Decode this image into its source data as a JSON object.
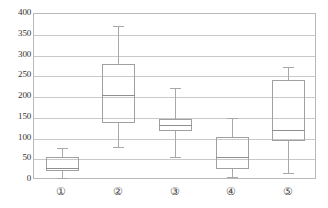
{
  "chart_data": {
    "type": "box",
    "title": "",
    "xlabel": "",
    "ylabel": "",
    "ylim": [
      0,
      400
    ],
    "yticks": [
      0,
      50,
      100,
      150,
      200,
      250,
      300,
      350,
      400
    ],
    "ytick_labels": [
      "0",
      "50",
      "100",
      "150",
      "200",
      "250",
      "300",
      "350",
      "400"
    ],
    "grid": true,
    "legend": "none",
    "categories": [
      "①",
      "②",
      "③",
      "④",
      "⑤"
    ],
    "category_labels": [
      "1",
      "2",
      "3",
      "4",
      "5"
    ],
    "boxes": [
      {
        "category": "①",
        "whisker_low": 5,
        "q1": 21,
        "median": 28,
        "q3": 55,
        "whisker_high": 78
      },
      {
        "category": "②",
        "whisker_low": 80,
        "q1": 137,
        "median": 205,
        "q3": 280,
        "whisker_high": 371
      },
      {
        "category": "③",
        "whisker_low": 55,
        "q1": 117,
        "median": 133,
        "q3": 148,
        "whisker_high": 222
      },
      {
        "category": "④",
        "whisker_low": 8,
        "q1": 27,
        "median": 55,
        "q3": 103,
        "whisker_high": 150
      },
      {
        "category": "⑤",
        "whisker_low": 16,
        "q1": 94,
        "median": 120,
        "q3": 241,
        "whisker_high": 272
      }
    ]
  },
  "style": {
    "axis_color": "#b9b9b9",
    "grid_color": "#c9c9c9",
    "box_color": "#a0a0a0",
    "whisker_color": "#a8a8a8",
    "median_color": "#8f8f8f",
    "text_color": "#333333",
    "background": "#ffffff"
  }
}
